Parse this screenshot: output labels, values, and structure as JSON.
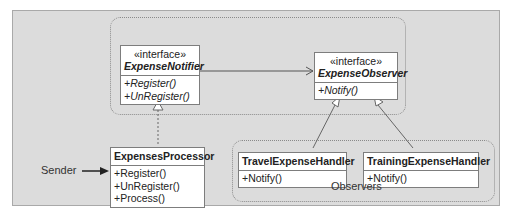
{
  "diagram": {
    "type": "uml-class-diagram",
    "background_color": "#dcdcdc",
    "groups": [
      {
        "id": "subject-group",
        "label": ""
      },
      {
        "id": "observers-group",
        "label": "Observers"
      }
    ],
    "classes": {
      "expense_notifier": {
        "stereotype": "«interface»",
        "name": "ExpenseNotifier",
        "operations": [
          "+Register()",
          "+UnRegister()"
        ]
      },
      "expense_observer": {
        "stereotype": "«interface»",
        "name": "ExpenseObserver",
        "operations": [
          "+Notify()"
        ]
      },
      "expenses_processor": {
        "name": "ExpensesProcessor",
        "operations": [
          "+Register()",
          "+UnRegister()",
          "+Process()"
        ]
      },
      "travel_expense_handler": {
        "name": "TravelExpenseHandler",
        "operations": [
          "+Notify()"
        ]
      },
      "training_expense_handler": {
        "name": "TrainingExpenseHandler",
        "operations": [
          "+Notify()"
        ]
      }
    },
    "relationships": [
      {
        "from": "ExpenseNotifier",
        "to": "ExpenseObserver",
        "kind": "association"
      },
      {
        "from": "ExpensesProcessor",
        "to": "ExpenseNotifier",
        "kind": "realization"
      },
      {
        "from": "TravelExpenseHandler",
        "to": "ExpenseObserver",
        "kind": "realization"
      },
      {
        "from": "TrainingExpenseHandler",
        "to": "ExpenseObserver",
        "kind": "realization"
      }
    ],
    "labels": {
      "sender": "Sender",
      "observers": "Observers"
    }
  }
}
